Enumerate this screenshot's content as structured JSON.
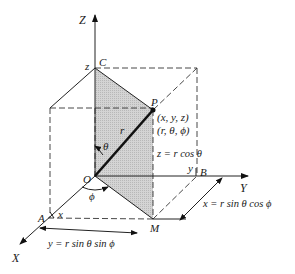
{
  "diagram": {
    "axes": {
      "x_label": "X",
      "y_label": "Y",
      "z_label": "Z"
    },
    "points": {
      "origin": "O",
      "point": "P",
      "c": "C",
      "a": "A",
      "b": "B",
      "m": "M"
    },
    "labels": {
      "z_at_c": "z",
      "x_at_a": "x",
      "y_at_b": "y",
      "radius": "r",
      "theta": "θ",
      "phi": "ϕ",
      "cartesian": "(x, y, z)",
      "spherical": "(r, θ, ϕ)"
    },
    "equations": {
      "z_eq": "z = r cos θ",
      "x_eq": "x = r sin θ cos ϕ",
      "y_eq": "y = r sin θ sin ϕ"
    },
    "colors": {
      "line": "#222222",
      "shading": "#c8c8c8",
      "background": "#ffffff"
    }
  }
}
